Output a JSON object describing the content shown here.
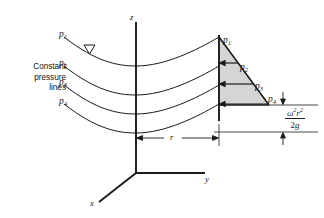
{
  "figure": {
    "caption": {
      "line1": "Constant",
      "line2": "pressure",
      "line3": "lines",
      "full": "Constant pressure lines"
    },
    "axes": {
      "z": {
        "label": "z"
      },
      "y": {
        "label": "y"
      },
      "x": {
        "label": "x"
      }
    },
    "pressure_lines": [
      {
        "id": "p1",
        "label": "p",
        "subscript": "1"
      },
      {
        "id": "p2",
        "label": "p",
        "subscript": "2"
      },
      {
        "id": "p3",
        "label": "p",
        "subscript": "3"
      },
      {
        "id": "p4",
        "label": "p",
        "subscript": "4"
      }
    ],
    "triangle_labels": [
      {
        "id": "p1",
        "label": "p",
        "subscript": "1"
      },
      {
        "id": "p2",
        "label": "p",
        "subscript": "2"
      },
      {
        "id": "p3",
        "label": "p",
        "subscript": "3"
      },
      {
        "id": "p4",
        "label": "p",
        "subscript": "4"
      }
    ],
    "radius_dimension": {
      "label": "r"
    },
    "height_formula": {
      "numerator_omega": "ω",
      "numerator_omega_exp": "2",
      "numerator_r": "r",
      "numerator_r_exp": "2",
      "denominator_two": "2",
      "denominator_g": "g",
      "plain": "ω²r² / 2g"
    },
    "free_surface_symbol": "free-surface-triangle",
    "colors": {
      "line": "#1a1a1a",
      "shade": "#d5d5d5",
      "background": "#ffffff"
    }
  }
}
